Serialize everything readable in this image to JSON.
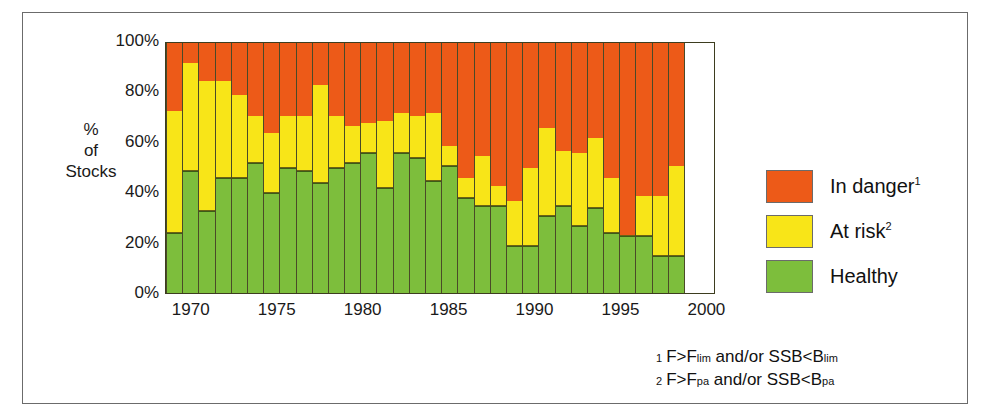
{
  "chart_data": {
    "type": "bar",
    "subtype": "stacked-100-percent",
    "title": "",
    "xlabel": "",
    "ylabel": "%\nof\nStocks",
    "ylim": [
      0,
      100
    ],
    "ytick_labels": [
      "0%",
      "20%",
      "40%",
      "60%",
      "80%",
      "100%"
    ],
    "ytick_values": [
      0,
      20,
      40,
      60,
      80,
      100
    ],
    "xtick_labels": [
      "1970",
      "1975",
      "1980",
      "1985",
      "1990",
      "1995",
      "2000"
    ],
    "xtick_values": [
      1970,
      1975,
      1980,
      1985,
      1990,
      1995,
      2000
    ],
    "grid": false,
    "legend_position": "right",
    "categories": [
      1969,
      1970,
      1971,
      1972,
      1973,
      1974,
      1975,
      1976,
      1977,
      1978,
      1979,
      1980,
      1981,
      1982,
      1983,
      1984,
      1985,
      1986,
      1987,
      1988,
      1989,
      1990,
      1991,
      1992,
      1993,
      1994,
      1995,
      1996,
      1997,
      1998,
      1999,
      2000
    ],
    "series": [
      {
        "name": "Healthy",
        "color": "#7DBE3C",
        "values": [
          24,
          49,
          33,
          46,
          46,
          52,
          40,
          50,
          49,
          44,
          50,
          52,
          56,
          42,
          56,
          54,
          45,
          51,
          38,
          35,
          35,
          19,
          19,
          31,
          35,
          27,
          34,
          24,
          23,
          23,
          15,
          15
        ]
      },
      {
        "name": "At risk",
        "color": "#F8E518",
        "values": [
          49,
          43,
          52,
          39,
          33,
          19,
          24,
          21,
          22,
          39,
          21,
          15,
          12,
          27,
          16,
          17,
          27,
          8,
          8,
          20,
          8,
          18,
          31,
          35,
          22,
          29,
          28,
          22,
          0,
          16,
          24,
          36
        ]
      },
      {
        "name": "In danger",
        "color": "#ED5A18",
        "values": [
          27,
          8,
          15,
          15,
          21,
          29,
          36,
          29,
          29,
          17,
          29,
          33,
          32,
          31,
          28,
          29,
          28,
          41,
          54,
          45,
          57,
          63,
          50,
          34,
          43,
          44,
          38,
          54,
          77,
          61,
          61,
          49
        ]
      }
    ]
  },
  "legend": {
    "items": [
      {
        "label": "In danger",
        "footnote_marker": "1",
        "key": "danger"
      },
      {
        "label": "At risk",
        "footnote_marker": "2",
        "key": "risk"
      },
      {
        "label": "Healthy",
        "footnote_marker": "",
        "key": "healthy"
      }
    ]
  },
  "footnotes": [
    {
      "num": "1",
      "pre": "F>F",
      "sub1": "lim",
      "mid": " and/or SSB<B",
      "sub2": "lim"
    },
    {
      "num": "2",
      "pre": "F>F",
      "sub1": "pa",
      "mid": " and/or SSB<B",
      "sub2": "pa"
    }
  ],
  "colors": {
    "danger": "#ED5A18",
    "risk": "#F8E518",
    "healthy": "#7DBE3C",
    "frame": "#6b6b6b",
    "text": "#1a1a1a"
  }
}
